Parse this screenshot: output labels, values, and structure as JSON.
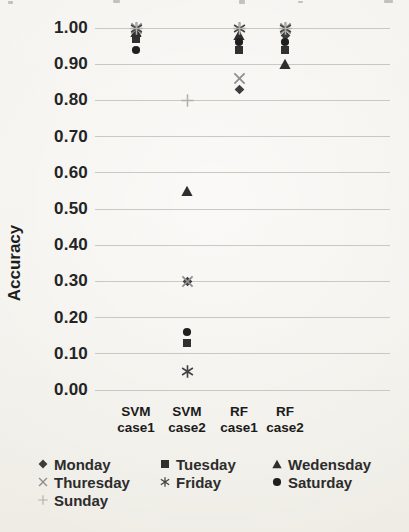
{
  "chart_data": {
    "type": "scatter",
    "title": "",
    "ylabel": "Accuracy",
    "xlabel": "",
    "ylim": [
      0.0,
      1.0
    ],
    "y_tick_step": 0.1,
    "y_ticks": [
      "1.00",
      "0.90",
      "0.80",
      "0.70",
      "0.60",
      "0.50",
      "0.40",
      "0.30",
      "0.20",
      "0.10",
      "0.00"
    ],
    "grid": true,
    "legend_position": "bottom",
    "categories": [
      [
        "SVM",
        "case1"
      ],
      [
        "SVM",
        "case2"
      ],
      [
        "RF",
        "case1"
      ],
      [
        "RF",
        "case2"
      ]
    ],
    "series": [
      {
        "name": "Monday",
        "marker": "diamond",
        "color": "#3d3d3d",
        "values": [
          0.98,
          0.3,
          0.83,
          0.98
        ]
      },
      {
        "name": "Tuesday",
        "marker": "square",
        "color": "#303030",
        "values": [
          0.97,
          0.13,
          0.94,
          0.94
        ]
      },
      {
        "name": "Wedensday",
        "marker": "triangle",
        "color": "#2e2e2e",
        "values": [
          0.99,
          0.55,
          0.98,
          0.9
        ]
      },
      {
        "name": "Thuresday",
        "marker": "x",
        "color": "#8f8f8f",
        "values": [
          1.0,
          0.3,
          0.86,
          1.0
        ]
      },
      {
        "name": "Friday",
        "marker": "asterisk",
        "color": "#424242",
        "values": [
          1.0,
          0.05,
          1.0,
          1.0
        ]
      },
      {
        "name": "Saturday",
        "marker": "circle",
        "color": "#1f1f1f",
        "values": [
          0.94,
          0.16,
          0.96,
          0.96
        ]
      },
      {
        "name": "Sunday",
        "marker": "plus",
        "color": "#b3b0aa",
        "values": [
          1.0,
          0.8,
          1.0,
          1.0
        ]
      }
    ]
  }
}
